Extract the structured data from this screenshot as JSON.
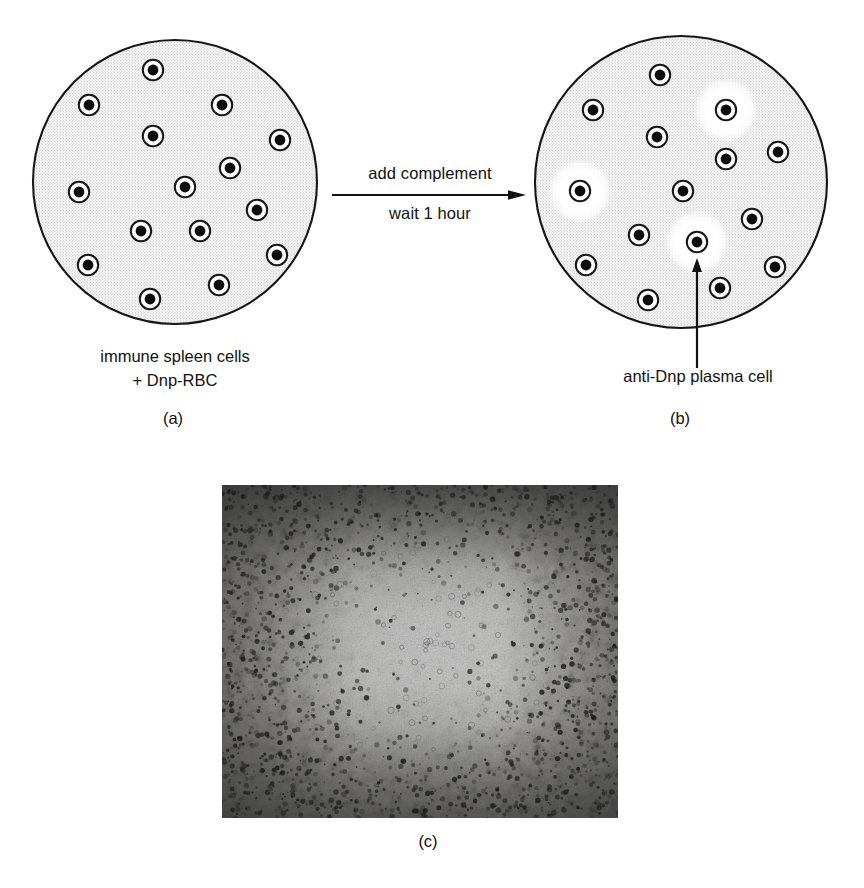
{
  "figure": {
    "type": "scientific-diagram",
    "background_color": "#ffffff",
    "ink_color": "#111111"
  },
  "panel_a": {
    "letter": "(a)",
    "caption_lines": [
      "immune spleen cells",
      "+ Dnp-RBC"
    ],
    "dish": {
      "fill_color": "#f0f0f0",
      "stipple_color": "#9a9a9a",
      "outline_color": "#161616",
      "center_x": 175,
      "center_y": 182,
      "radius": 142
    },
    "cells": [
      {
        "x": 153,
        "y": 70
      },
      {
        "x": 89,
        "y": 105
      },
      {
        "x": 222,
        "y": 105
      },
      {
        "x": 153,
        "y": 136
      },
      {
        "x": 280,
        "y": 140
      },
      {
        "x": 230,
        "y": 168
      },
      {
        "x": 79,
        "y": 192
      },
      {
        "x": 185,
        "y": 187
      },
      {
        "x": 257,
        "y": 210
      },
      {
        "x": 141,
        "y": 231
      },
      {
        "x": 200,
        "y": 231
      },
      {
        "x": 277,
        "y": 255
      },
      {
        "x": 88,
        "y": 265
      },
      {
        "x": 219,
        "y": 285
      },
      {
        "x": 150,
        "y": 299
      }
    ],
    "cell_count": 15
  },
  "panel_b": {
    "letter": "(b)",
    "pointer_label": "anti-Dnp plasma cell",
    "dish": {
      "fill_color": "#f0f0f0",
      "stipple_color": "#9a9a9a",
      "outline_color": "#161616",
      "center_x": 681,
      "center_y": 182,
      "radius": 146
    },
    "cells": [
      {
        "x": 660,
        "y": 75,
        "plaque": false
      },
      {
        "x": 593,
        "y": 110,
        "plaque": false
      },
      {
        "x": 726,
        "y": 110,
        "plaque": true
      },
      {
        "x": 657,
        "y": 137,
        "plaque": false
      },
      {
        "x": 778,
        "y": 152,
        "plaque": false
      },
      {
        "x": 726,
        "y": 159,
        "plaque": false
      },
      {
        "x": 580,
        "y": 191,
        "plaque": true
      },
      {
        "x": 683,
        "y": 191,
        "plaque": false
      },
      {
        "x": 752,
        "y": 219,
        "plaque": false
      },
      {
        "x": 639,
        "y": 235,
        "plaque": false
      },
      {
        "x": 697,
        "y": 242,
        "plaque": true
      },
      {
        "x": 775,
        "y": 267,
        "plaque": false
      },
      {
        "x": 586,
        "y": 265,
        "plaque": false
      },
      {
        "x": 720,
        "y": 288,
        "plaque": false
      },
      {
        "x": 648,
        "y": 300,
        "plaque": false
      }
    ],
    "cell_count": 15,
    "plaque_count": 3,
    "plaque_color": "#ffffff",
    "arrow": {
      "from_x": 697,
      "from_y": 368,
      "to_x": 697,
      "to_y": 258
    }
  },
  "transition": {
    "label_top": "add complement",
    "label_bottom": "wait 1 hour",
    "arrow_direction": "right"
  },
  "panel_c": {
    "letter": "(c)",
    "kind": "photomicrograph",
    "description": "grayscale micrograph of an erythrocyte monolayer with a central cleared plaque zone",
    "left": 222,
    "top": 485,
    "width": 396,
    "height": 333,
    "base_gray": "#d8d5d0",
    "dark_gray": "#2a2a2a"
  }
}
